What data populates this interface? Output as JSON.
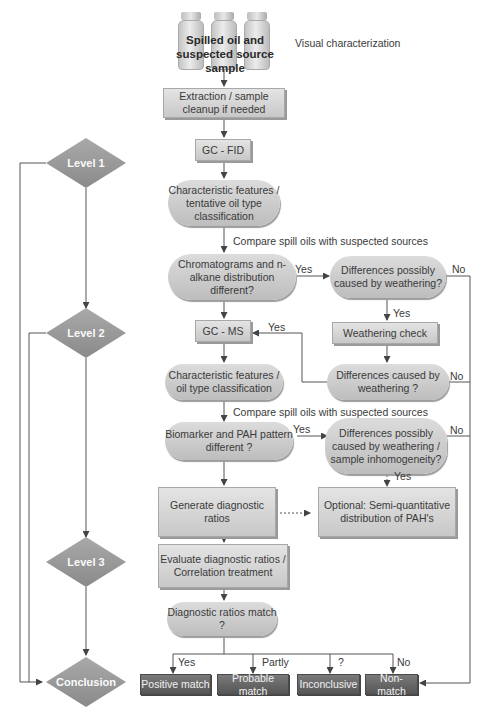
{
  "start": {
    "title": "Spilled oil and suspected source sample",
    "note": "Visual characterization"
  },
  "steps": {
    "extraction": "Extraction / sample cleanup if needed",
    "gcfid": "GC - FID",
    "char1": "Characteristic features / tentative oil type classification",
    "compare1": "Compare spill oils with suspected sources",
    "chrom_diff": "Chromatograms and n-alkane distribution different?",
    "diff_weather1": "Differences possibly caused by weathering?",
    "weathering_check": "Weathering check",
    "gcms": "GC - MS",
    "diff_caused": "Differences caused by weathering ?",
    "char2": "Characteristic features / oil type classification",
    "compare2": "Compare spill oils with suspected sources",
    "biomarker": "Biomarker and PAH pattern different ?",
    "diff_weather2": "Differences possibly caused by weathering / sample inhomogeneity?",
    "generate": "Generate diagnostic ratios",
    "optional": "Optional: Semi-quantitative distribution of PAH's",
    "evaluate": "Evaluate diagnostic ratios / Correlation treatment",
    "ratios_match": "Diagnostic ratios match ?"
  },
  "levels": [
    "Level 1",
    "Level 2",
    "Level 3",
    "Conclusion"
  ],
  "outcomes": [
    "Positive match",
    "Probable match",
    "Inconclusive",
    "Non-match"
  ],
  "edge_labels": {
    "yes": "Yes",
    "no": "No",
    "partly": "Partly",
    "question": "?"
  }
}
